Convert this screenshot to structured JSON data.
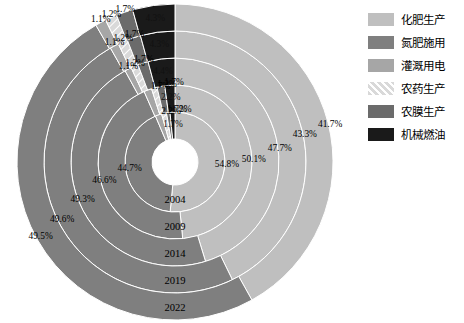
{
  "chart_data": {
    "type": "pie",
    "title": "",
    "subtype": "nested-donut-sunburst",
    "legend_position": "right",
    "categories": [
      "化肥生产",
      "氮肥施用",
      "灌溉用电",
      "农药生产",
      "农膜生产",
      "机械燃油"
    ],
    "category_colors": [
      "#bfbfbf",
      "#7f7f7f",
      "#a6a6a6",
      "#d9d9d9",
      "#6b6b6b",
      "#1a1a1a"
    ],
    "rings": [
      {
        "name": "2004",
        "ring_index": 0,
        "values": [
          54.8,
          44.7,
          2.2,
          1.7,
          1.2,
          1.7
        ],
        "labels": [
          "54.8%",
          "44.7%",
          "2.2%",
          "1.7%",
          "1.2%",
          "1.7%"
        ]
      },
      {
        "name": "2009",
        "ring_index": 1,
        "values": [
          50.1,
          46.6,
          1.7,
          1.2,
          1.7,
          2.2
        ],
        "labels": [
          "50.1%",
          "46.6%",
          "1.7%",
          "1.2%",
          "1.7%",
          "2.2%"
        ]
      },
      {
        "name": "2014",
        "ring_index": 2,
        "values": [
          47.7,
          49.3,
          1.1,
          1.2,
          1.7,
          4.4
        ],
        "labels": [
          "47.7%",
          "49.3%",
          "1.1%",
          "1.2%",
          "1.7%",
          "4.4%"
        ]
      },
      {
        "name": "2019",
        "ring_index": 3,
        "values": [
          43.3,
          49.6,
          1.1,
          1.2,
          1.7,
          4.3
        ],
        "labels": [
          "43.3%",
          "49.6%",
          "1.1%",
          "1.2%",
          "1.7%",
          "4.3%"
        ]
      },
      {
        "name": "2022",
        "ring_index": 4,
        "values": [
          41.7,
          49.5,
          1.1,
          1.2,
          1.7,
          4.3
        ],
        "labels": [
          "41.7%",
          "49.5%",
          "1.1%",
          "1.2%",
          "1.7%",
          "4.3%"
        ]
      }
    ],
    "ring_year_labels": [
      "2004",
      "2009",
      "2014",
      "2019",
      "2022"
    ],
    "outer_pct_labels_right": [
      "54.8%",
      "50.1%",
      "47.7%",
      "43.3%",
      "41.7%"
    ],
    "outer_pct_labels_left": [
      "44.7%",
      "46.6%",
      "49.3%",
      "49.6%",
      "49.5%"
    ],
    "small_pct_labels": [
      "2.2%",
      "1.7%",
      "1.2%",
      "1.7%",
      "1.1%",
      "4.4%",
      "4.3%"
    ]
  },
  "legend": {
    "items": [
      {
        "label": "化肥生产",
        "color": "#bfbfbf",
        "pattern": "solid"
      },
      {
        "label": "氮肥施用",
        "color": "#7f7f7f",
        "pattern": "solid"
      },
      {
        "label": "灌溉用电",
        "color": "#a6a6a6",
        "pattern": "solid"
      },
      {
        "label": "农药生产",
        "color": "#d9d9d9",
        "pattern": "hatch"
      },
      {
        "label": "农膜生产",
        "color": "#6b6b6b",
        "pattern": "solid"
      },
      {
        "label": "机械燃油",
        "color": "#1a1a1a",
        "pattern": "solid"
      }
    ]
  },
  "background": "#ffffff"
}
